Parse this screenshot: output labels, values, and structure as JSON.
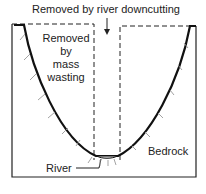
{
  "diagram": {
    "title": "Removed by river downcutting",
    "labels": {
      "mass_wasting": [
        "Removed",
        "by",
        "mass",
        "wasting"
      ],
      "river": "River",
      "bedrock": "Bedrock"
    },
    "colors": {
      "line": "#1a1a1a",
      "hatch": "#888888",
      "background": "#ffffff"
    }
  }
}
